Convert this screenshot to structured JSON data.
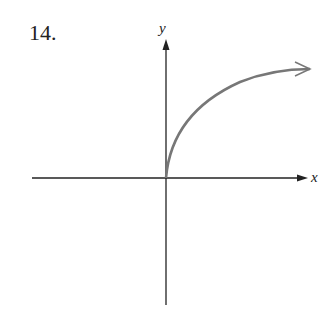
{
  "problem_number": "14.",
  "axes": {
    "x_label": "x",
    "y_label": "y"
  },
  "curve": {
    "description": "increasing concave-down curve starting at origin, approaching horizontal asymptote",
    "color": "#777777",
    "start": [
      0,
      0
    ],
    "end_arrow": "open"
  },
  "colors": {
    "axis": "#222222",
    "curve": "#777777"
  }
}
